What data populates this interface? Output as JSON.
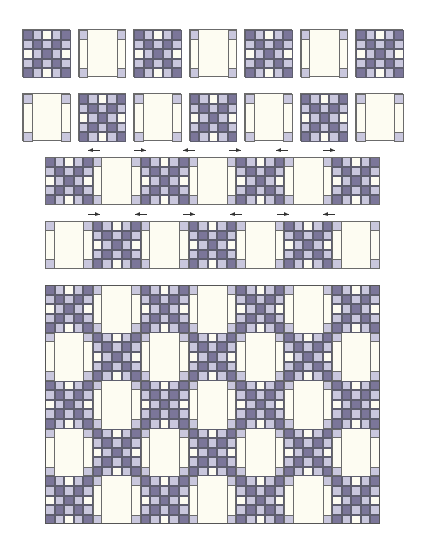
{
  "colors": {
    "dark": "#7b7699",
    "light": "#c9c7dd",
    "cream": "#fdfcf2",
    "border": "#5e5e6e",
    "arrow": "#333333"
  },
  "nine_patch_pattern": [
    [
      "D",
      "L",
      "C",
      "L",
      "D"
    ],
    [
      "L",
      "D",
      "L",
      "D",
      "L"
    ],
    [
      "C",
      "L",
      "D",
      "L",
      "C"
    ],
    [
      "L",
      "D",
      "L",
      "D",
      "L"
    ],
    [
      "D",
      "L",
      "C",
      "L",
      "D"
    ]
  ],
  "plain_block": {
    "corner_color": "L",
    "strip_color": "C",
    "center_color": "C"
  },
  "steps": [
    {
      "name": "step-1-block-row-a",
      "x": 22,
      "y": 29,
      "block_size": 48,
      "spacing": 55.5,
      "blocks": [
        "nine",
        "plain",
        "nine",
        "plain",
        "nine",
        "plain",
        "nine"
      ],
      "joined": false
    },
    {
      "name": "step-1-block-row-b",
      "x": 22,
      "y": 93,
      "block_size": 48,
      "spacing": 55.5,
      "blocks": [
        "plain",
        "nine",
        "plain",
        "nine",
        "plain",
        "nine",
        "plain"
      ],
      "joined": false
    },
    {
      "name": "step-2-sewn-row-a",
      "x": 45,
      "y": 157,
      "block_size": 47.86,
      "spacing": 47.86,
      "blocks": [
        "nine",
        "plain",
        "nine",
        "plain",
        "nine",
        "plain",
        "nine"
      ],
      "joined": true,
      "arrows": [
        {
          "x": 87,
          "dir": "left"
        },
        {
          "x": 133,
          "dir": "right"
        },
        {
          "x": 182,
          "dir": "left"
        },
        {
          "x": 228,
          "dir": "right"
        },
        {
          "x": 275,
          "dir": "left"
        },
        {
          "x": 322,
          "dir": "right"
        }
      ]
    },
    {
      "name": "step-2-sewn-row-b",
      "x": 45,
      "y": 221,
      "block_size": 47.86,
      "spacing": 47.86,
      "blocks": [
        "plain",
        "nine",
        "plain",
        "nine",
        "plain",
        "nine",
        "plain"
      ],
      "joined": true,
      "arrows": [
        {
          "x": 87,
          "dir": "right"
        },
        {
          "x": 134,
          "dir": "left"
        },
        {
          "x": 182,
          "dir": "right"
        },
        {
          "x": 229,
          "dir": "left"
        },
        {
          "x": 276,
          "dir": "right"
        },
        {
          "x": 322,
          "dir": "left"
        }
      ]
    }
  ],
  "quilt": {
    "name": "assembled-quilt-top",
    "x": 45,
    "y": 285,
    "block_size": 47.86,
    "rows": [
      [
        "nine",
        "plain",
        "nine",
        "plain",
        "nine",
        "plain",
        "nine"
      ],
      [
        "plain",
        "nine",
        "plain",
        "nine",
        "plain",
        "nine",
        "plain"
      ],
      [
        "nine",
        "plain",
        "nine",
        "plain",
        "nine",
        "plain",
        "nine"
      ],
      [
        "plain",
        "nine",
        "plain",
        "nine",
        "plain",
        "nine",
        "plain"
      ],
      [
        "nine",
        "plain",
        "nine",
        "plain",
        "nine",
        "plain",
        "nine"
      ]
    ]
  }
}
